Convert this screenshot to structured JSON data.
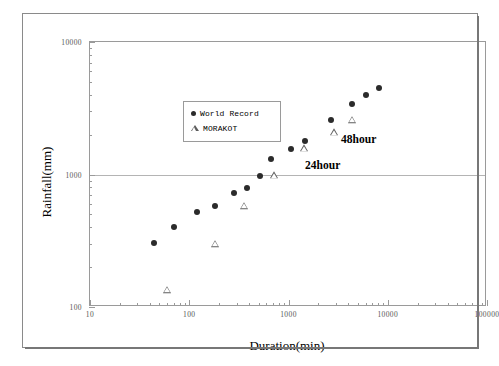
{
  "figure": {
    "x_axis_title": "Duration(min)",
    "y_axis_title": "Rainfall(mm)"
  },
  "legend": {
    "entries": [
      {
        "label": "World Record",
        "marker": "filled-circle"
      },
      {
        "label": "MORAKOT",
        "marker": "open-triangle"
      }
    ]
  },
  "annotations": [
    {
      "text": "48hour",
      "x": 2880,
      "y": 1820
    },
    {
      "text": "24hour",
      "x": 1250,
      "y": 1150
    }
  ],
  "chart_data": {
    "type": "scatter",
    "title": "",
    "xlabel": "Duration(min)",
    "ylabel": "Rainfall(mm)",
    "xscale": "log",
    "yscale": "log",
    "xlim": [
      10,
      100000
    ],
    "ylim": [
      100,
      10000
    ],
    "xticks": [
      10,
      100,
      1000,
      10000,
      100000
    ],
    "xtick_labels": [
      "10",
      "100",
      "1000",
      "10000",
      "100000"
    ],
    "yticks": [
      100,
      1000,
      10000
    ],
    "ytick_labels": [
      "100",
      "1000",
      "10000"
    ],
    "grid": "horizontal-at-1000",
    "legend_position": "upper-left-inside",
    "series": [
      {
        "name": "World Record",
        "marker": "filled-circle",
        "color": "#2b2b2b",
        "points": [
          [
            44,
            305
          ],
          [
            70,
            400
          ],
          [
            120,
            520
          ],
          [
            180,
            580
          ],
          [
            280,
            730
          ],
          [
            380,
            790
          ],
          [
            520,
            980
          ],
          [
            670,
            1300
          ],
          [
            1050,
            1550
          ],
          [
            1450,
            1800
          ],
          [
            2700,
            2600
          ],
          [
            4400,
            3400
          ],
          [
            6000,
            3950
          ],
          [
            8200,
            4500
          ]
        ]
      },
      {
        "name": "MORAKOT",
        "marker": "open-triangle",
        "color": "#5d5d5d",
        "points": [
          [
            60,
            135
          ],
          [
            180,
            300
          ],
          [
            360,
            580
          ],
          [
            720,
            990
          ],
          [
            1440,
            1580
          ],
          [
            2880,
            2080
          ],
          [
            4320,
            2600
          ]
        ]
      }
    ]
  }
}
